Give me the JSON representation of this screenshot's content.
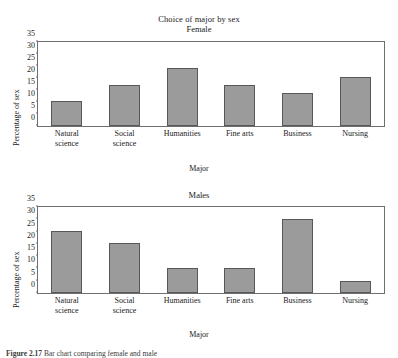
{
  "figure": {
    "main_title": "Choice of major by sex",
    "caption_label": "Figure",
    "caption_number": "2.17",
    "caption_text": "Bar chart comparing female and male"
  },
  "chart_data": [
    {
      "type": "bar",
      "title": "Female",
      "xlabel": "Major",
      "ylabel": "Percentage of sex",
      "ylim": [
        0,
        35
      ],
      "yticks": [
        0,
        5,
        10,
        15,
        20,
        25,
        30,
        35
      ],
      "grid": false,
      "legend": "none",
      "bar_color": "#9b9b9b",
      "bar_edge_color": "#585858",
      "categories": [
        "Natural science",
        "Social science",
        "Humanities",
        "Fine arts",
        "Business",
        "Nursing"
      ],
      "category_lines": [
        [
          "Natural",
          "science"
        ],
        [
          "Social",
          "science"
        ],
        [
          "Humanities"
        ],
        [
          "Fine arts"
        ],
        [
          "Business"
        ],
        [
          "Nursing"
        ]
      ],
      "values": [
        10.5,
        17,
        24,
        17,
        13.8,
        20.5
      ]
    },
    {
      "type": "bar",
      "title": "Males",
      "xlabel": "Major",
      "ylabel": "Percentage of sex",
      "ylim": [
        0,
        35
      ],
      "yticks": [
        0,
        5,
        10,
        15,
        20,
        25,
        30,
        35
      ],
      "grid": false,
      "legend": "none",
      "bar_color": "#9b9b9b",
      "bar_edge_color": "#585858",
      "categories": [
        "Natural science",
        "Social science",
        "Humanities",
        "Fine arts",
        "Business",
        "Nursing"
      ],
      "category_lines": [
        [
          "Natural",
          "science"
        ],
        [
          "Social",
          "science"
        ],
        [
          "Humanities"
        ],
        [
          "Fine arts"
        ],
        [
          "Business"
        ],
        [
          "Nursing"
        ]
      ],
      "values": [
        25.2,
        20.2,
        10,
        10,
        30.2,
        5
      ]
    }
  ]
}
